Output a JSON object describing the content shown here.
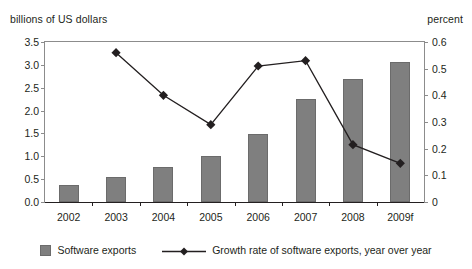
{
  "chart_data": {
    "type": "bar",
    "title": "",
    "categories": [
      "2002",
      "2003",
      "2004",
      "2005",
      "2006",
      "2007",
      "2008",
      "2009f"
    ],
    "series": [
      {
        "name": "Software exports",
        "type": "bar",
        "axis": "left",
        "values": [
          0.37,
          0.54,
          0.76,
          1.0,
          1.49,
          2.25,
          2.7,
          3.07
        ],
        "color": "#7f7f7f"
      },
      {
        "name": "Growth rate of software exports, year over year",
        "type": "line",
        "axis": "right",
        "values": [
          null,
          0.56,
          0.4,
          0.29,
          0.51,
          0.53,
          0.215,
          0.145
        ],
        "color": "#231f20",
        "marker": "diamond"
      }
    ],
    "xlabel": "",
    "ylabel": "billions of US dollars",
    "y2label": "percent",
    "ylim": [
      0,
      3.5
    ],
    "y2lim": [
      0,
      0.6
    ],
    "yticks": [
      "0.0",
      "0.5",
      "1.0",
      "1.5",
      "2.0",
      "2.5",
      "3.0",
      "3.5"
    ],
    "ytick_values": [
      0,
      0.5,
      1.0,
      1.5,
      2.0,
      2.5,
      3.0,
      3.5
    ],
    "y2ticks": [
      "0",
      "0.1",
      "0.2",
      "0.3",
      "0.4",
      "0.5",
      "0.6"
    ],
    "y2tick_values": [
      0,
      0.1,
      0.2,
      0.3,
      0.4,
      0.5,
      0.6
    ],
    "grid": false,
    "legend_position": "bottom"
  },
  "axes": {
    "left_title": "billions of US dollars",
    "right_title": "percent"
  },
  "legend": {
    "items": [
      {
        "label": "Software exports",
        "marker": "square-swatch"
      },
      {
        "label": "Growth rate of software exports, year over year",
        "marker": "line-with-diamond"
      }
    ]
  }
}
